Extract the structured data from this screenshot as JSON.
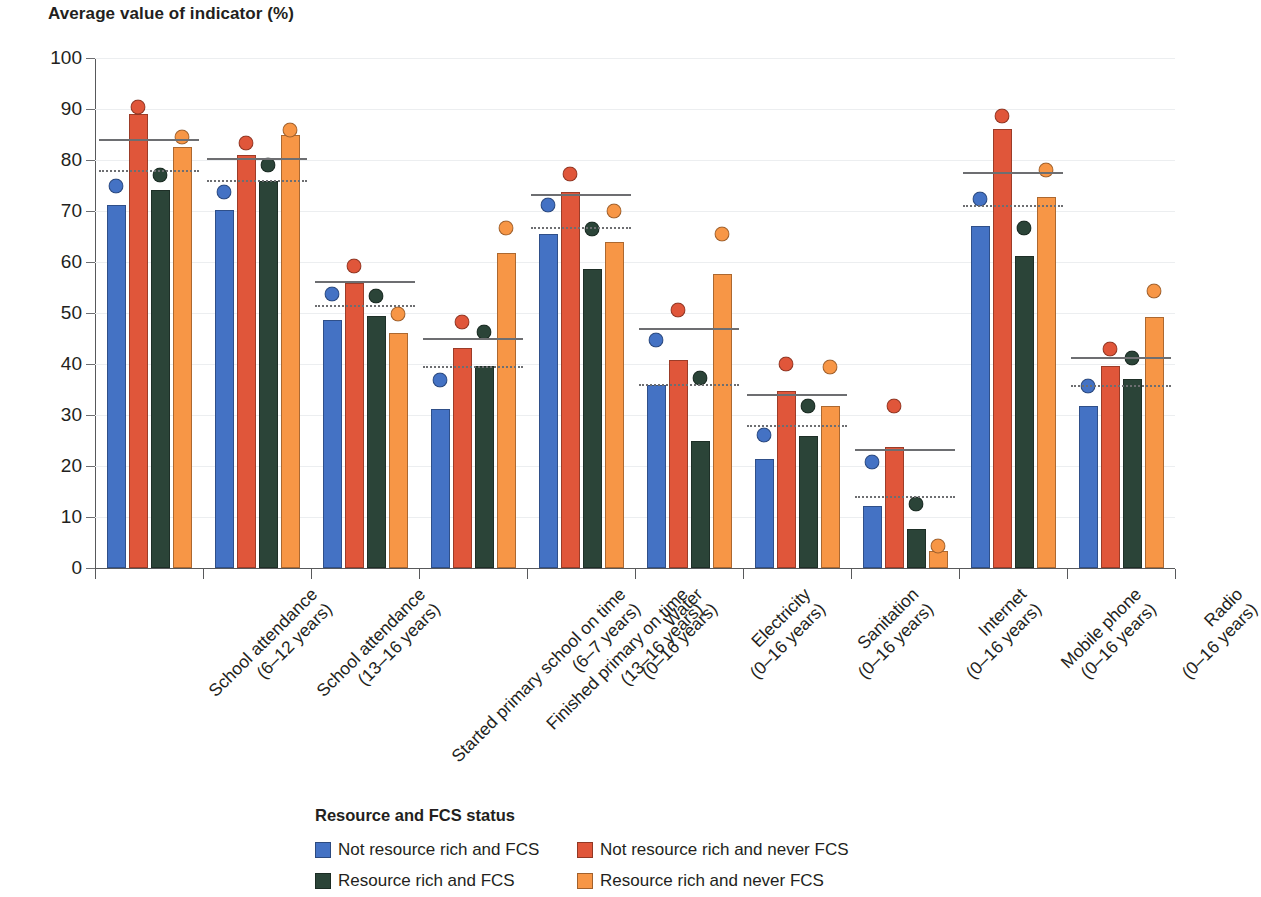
{
  "chart_data": {
    "type": "bar",
    "title": "Average value of indicator (%)",
    "xlabel": "",
    "ylabel": "Average value of indicator (%)",
    "ylim": [
      0,
      100
    ],
    "yticks": [
      0,
      10,
      20,
      30,
      40,
      50,
      60,
      70,
      80,
      90,
      100
    ],
    "grid": true,
    "legend_position": "bottom",
    "legend_title": "Resource and FCS status",
    "categories": [
      "School attendance\n(6–12 years)",
      "School attendance\n(13–16 years)",
      "Started primary school on time\n(6–7 years)",
      "Finished primary on time\n(13–16 years)",
      "Water\n(0–16 years)",
      "Electricity\n(0–16 years)",
      "Sanitation\n(0–16 years)",
      "Internet\n(0–16 years)",
      "Mobile phone\n(0–16 years)",
      "Radio\n(0–16 years)"
    ],
    "category_lines": [
      [
        "School attendance",
        "(6–12 years)"
      ],
      [
        "School attendance",
        "(13–16 years)"
      ],
      [
        "Started primary school on time",
        "(6–7 years)"
      ],
      [
        "Finished primary on time",
        "(13–16 years)"
      ],
      [
        "Water",
        "(0–16 years)"
      ],
      [
        "Electricity",
        "(0–16 years)"
      ],
      [
        "Sanitation",
        "(0–16 years)"
      ],
      [
        "Internet",
        "(0–16 years)"
      ],
      [
        "Mobile phone",
        "(0–16 years)"
      ],
      [
        "Radio",
        "(0–16 years)"
      ]
    ],
    "series": [
      {
        "name": "Not resource rich and FCS",
        "color": "#4472c4",
        "values": [
          71.2,
          70.2,
          48.7,
          31.2,
          65.5,
          35.8,
          21.4,
          12.1,
          67.0,
          31.8
        ],
        "dots": [
          76.3,
          75.2,
          55.2,
          38.4,
          72.6,
          46.2,
          27.5,
          22.2,
          73.8,
          37.2
        ]
      },
      {
        "name": "Not resource rich and never FCS",
        "color": "#e0563a",
        "values": [
          89.0,
          81.0,
          55.8,
          43.2,
          73.8,
          40.7,
          34.8,
          23.7,
          86.1,
          39.6
        ],
        "dots": [
          91.9,
          84.9,
          60.6,
          49.8,
          78.7,
          52.0,
          41.4,
          33.2,
          90.1,
          44.4
        ]
      },
      {
        "name": "Resource rich and FCS",
        "color": "#2b4438",
        "values": [
          74.2,
          75.9,
          49.4,
          39.7,
          58.6,
          25.0,
          25.8,
          7.7,
          61.2,
          37.0
        ],
        "dots": [
          78.6,
          80.4,
          54.9,
          47.8,
          67.9,
          38.7,
          33.2,
          14.1,
          68.2,
          42.6
        ]
      },
      {
        "name": "Resource rich and never FCS",
        "color": "#f79646",
        "values": [
          82.5,
          85.0,
          46.0,
          61.7,
          63.9,
          57.6,
          31.8,
          3.4,
          72.8,
          49.3
        ],
        "dots": [
          85.9,
          87.4,
          51.3,
          68.2,
          71.4,
          67.0,
          40.8,
          5.8,
          79.6,
          55.8
        ]
      }
    ],
    "reference_lines": [
      {
        "category": "School attendance\n(6–12 years)",
        "solid": 84.1,
        "dotted": 78.0
      },
      {
        "category": "School attendance\n(13–16 years)",
        "solid": 80.4,
        "dotted": 76.1
      },
      {
        "category": "Started primary school on time\n(6–7 years)",
        "solid": 56.2,
        "dotted": 51.6
      },
      {
        "category": "Finished primary on time\n(13–16 years)",
        "solid": 45.1,
        "dotted": 39.6
      },
      {
        "category": "Water\n(0–16 years)",
        "solid": 73.4,
        "dotted": 66.8
      },
      {
        "category": "Electricity\n(0–16 years)",
        "solid": 47.0,
        "dotted": 36.0
      },
      {
        "category": "Sanitation\n(0–16 years)",
        "solid": 34.2,
        "dotted": 28.1
      },
      {
        "category": "Internet\n(0–16 years)",
        "solid": 23.4,
        "dotted": 14.2
      },
      {
        "category": "Mobile phone\n(0–16 years)",
        "solid": 77.6,
        "dotted": 71.1
      },
      {
        "category": "Radio\n(0–16 years)",
        "solid": 41.3,
        "dotted": 35.9
      }
    ],
    "annotations": {
      "solid_line_meaning": "",
      "dotted_line_meaning": ""
    }
  },
  "legend": {
    "title": "Resource and FCS status",
    "items": [
      {
        "label": "Not resource rich and FCS",
        "color": "#4472c4"
      },
      {
        "label": "Not resource rich and never FCS",
        "color": "#e0563a"
      },
      {
        "label": "Resource rich and FCS",
        "color": "#2b4438"
      },
      {
        "label": "Resource rich and never FCS",
        "color": "#f79646"
      }
    ]
  },
  "colors": {
    "axis": "#58595b",
    "reference_line": "#6d6e71",
    "grid": "#eceef0",
    "text": "#231f20"
  }
}
